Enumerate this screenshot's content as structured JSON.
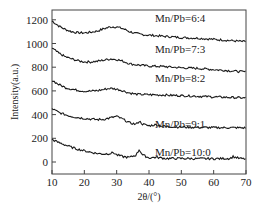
{
  "chart_data": {
    "type": "line",
    "title": "",
    "xlabel": "2θ/(°)",
    "ylabel": "Intensity(a.u.)",
    "xlim": [
      10,
      70
    ],
    "ylim": [
      -80,
      1300
    ],
    "xticks": [
      10,
      20,
      30,
      40,
      50,
      60,
      70
    ],
    "yticks": [
      0,
      200,
      400,
      600,
      800,
      1000,
      1200
    ],
    "grid": false,
    "legend": "inline labels",
    "series": [
      {
        "name": "Mn/Pb=6:4",
        "label": "Mn/Pb=6:4",
        "x": [
          10,
          12,
          14,
          16,
          18,
          20,
          22,
          24,
          26,
          28,
          30,
          32,
          34,
          36,
          38,
          40,
          45,
          50,
          55,
          60,
          65,
          70
        ],
        "values": [
          1190,
          1150,
          1120,
          1100,
          1090,
          1090,
          1095,
          1105,
          1125,
          1140,
          1140,
          1125,
          1100,
          1085,
          1075,
          1070,
          1060,
          1050,
          1045,
          1035,
          1025,
          1015
        ]
      },
      {
        "name": "Mn/Pb=7:3",
        "label": "Mn/Pb=7:3",
        "x": [
          10,
          12,
          14,
          16,
          18,
          20,
          22,
          24,
          26,
          28,
          30,
          32,
          34,
          36,
          38,
          40,
          45,
          50,
          55,
          60,
          65,
          70
        ],
        "values": [
          960,
          920,
          890,
          870,
          855,
          845,
          845,
          850,
          860,
          870,
          865,
          850,
          830,
          820,
          815,
          810,
          805,
          795,
          790,
          780,
          770,
          760
        ]
      },
      {
        "name": "Mn/Pb=8:2",
        "label": "Mn/Pb=8:2",
        "x": [
          10,
          12,
          14,
          16,
          18,
          20,
          22,
          24,
          26,
          28,
          30,
          32,
          34,
          36,
          38,
          40,
          45,
          50,
          55,
          60,
          65,
          70
        ],
        "values": [
          690,
          655,
          630,
          615,
          605,
          598,
          598,
          602,
          612,
          622,
          615,
          600,
          582,
          572,
          570,
          568,
          565,
          560,
          555,
          550,
          545,
          540
        ]
      },
      {
        "name": "Mn/Pb=9:1",
        "label": "Mn/Pb=9:1",
        "x": [
          10,
          12,
          14,
          16,
          18,
          20,
          22,
          24,
          26,
          28,
          30,
          32,
          34,
          36,
          37,
          38,
          40,
          42,
          45,
          50,
          55,
          60,
          65,
          70
        ],
        "values": [
          450,
          420,
          400,
          385,
          375,
          368,
          362,
          358,
          360,
          372,
          385,
          360,
          330,
          318,
          345,
          320,
          305,
          315,
          300,
          295,
          292,
          290,
          290,
          288
        ]
      },
      {
        "name": "Mn/Pb=10:0",
        "label": "Mn/Pb=10:0",
        "x": [
          10,
          12,
          14,
          16,
          18,
          20,
          22,
          24,
          26,
          28,
          29,
          30,
          32,
          34,
          36,
          37,
          38,
          40,
          42,
          45,
          50,
          55,
          60,
          65,
          66,
          68,
          70
        ],
        "values": [
          190,
          165,
          145,
          125,
          108,
          95,
          82,
          72,
          68,
          72,
          80,
          60,
          45,
          38,
          60,
          105,
          60,
          35,
          40,
          30,
          30,
          28,
          28,
          30,
          45,
          30,
          25
        ]
      }
    ]
  },
  "labels": {
    "xlabel": "2θ/(°)",
    "ylabel": "Intensity(a.u.)",
    "xticks": [
      "10",
      "20",
      "30",
      "40",
      "50",
      "60",
      "70"
    ],
    "yticks": [
      "0",
      "200",
      "400",
      "600",
      "800",
      "1000",
      "1200"
    ],
    "series": [
      "Mn/Pb=6:4",
      "Mn/Pb=7:3",
      "Mn/Pb=8:2",
      "Mn/Pb=9:1",
      "Mn/Pb=10:0"
    ]
  }
}
